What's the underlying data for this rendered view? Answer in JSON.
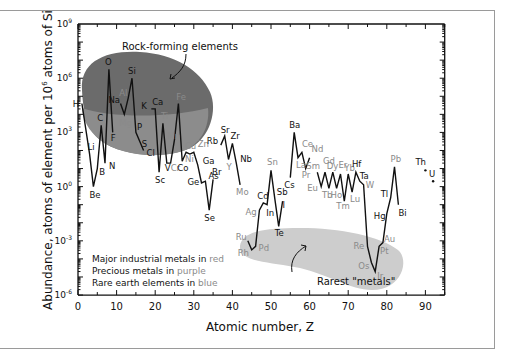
{
  "chart_data": {
    "type": "line",
    "title": "",
    "xlabel": "Atomic number, Z",
    "ylabel": "Abundance, atoms of element per 10^6 atoms of Si",
    "ylabel_parts": {
      "pre": "Abundance, atoms of element per 10",
      "sup": "6",
      "post": " atoms of Si"
    },
    "xlim": [
      0,
      95
    ],
    "ylim_log10": [
      -6,
      9
    ],
    "xticks": [
      0,
      10,
      20,
      30,
      40,
      50,
      60,
      70,
      80,
      90
    ],
    "yticks": [
      {
        "base": "10",
        "exp": "9",
        "v": 9
      },
      {
        "base": "10",
        "exp": "6",
        "v": 6
      },
      {
        "base": "10",
        "exp": "3",
        "v": 3
      },
      {
        "base": "10",
        "exp": "0",
        "v": 0
      },
      {
        "base": "10",
        "exp": "-3",
        "v": -3
      },
      {
        "base": "10",
        "exp": "-6",
        "v": -6
      }
    ],
    "grid": false,
    "y_scale": "log",
    "colors": {
      "red": "#7a7a7a",
      "purple": "#8a8a8a",
      "blue": "#8a8a8a",
      "black": "#111111",
      "rock_region": "#6e6e6e",
      "rock_region_light": "#8f8f8f",
      "rare_region": "#cfcfcf"
    },
    "elements": [
      {
        "s": "H",
        "z": 1,
        "log": 4.6,
        "c": "black",
        "dx": -9,
        "dy": 3
      },
      {
        "s": "Li",
        "z": 3,
        "log": 1.8,
        "c": "black",
        "dx": -2,
        "dy": -4
      },
      {
        "s": "Be",
        "z": 4,
        "log": 0.0,
        "c": "black",
        "dx": -4,
        "dy": 11
      },
      {
        "s": "B",
        "z": 5,
        "log": 1.0,
        "c": "black",
        "dx": 2,
        "dy": 6
      },
      {
        "s": "C",
        "z": 6,
        "log": 3.4,
        "c": "black",
        "dx": -4,
        "dy": -4
      },
      {
        "s": "N",
        "z": 7,
        "log": 1.3,
        "c": "black",
        "dx": 4,
        "dy": 6
      },
      {
        "s": "O",
        "z": 8,
        "log": 6.5,
        "c": "black",
        "dx": -4,
        "dy": -4
      },
      {
        "s": "F",
        "z": 9,
        "log": 3.0,
        "c": "black",
        "dx": -2,
        "dy": 9
      },
      {
        "s": "Na",
        "z": 11,
        "log": 4.6,
        "c": "black",
        "dx": -12,
        "dy": -1
      },
      {
        "s": "Mg",
        "z": 12,
        "log": 4.0,
        "c": "red",
        "dx": -5,
        "dy": 12
      },
      {
        "s": "Al",
        "z": 13,
        "log": 4.9,
        "c": "red",
        "dx": -9,
        "dy": -2
      },
      {
        "s": "Si",
        "z": 14,
        "log": 6.0,
        "c": "black",
        "dx": -4,
        "dy": -4
      },
      {
        "s": "P",
        "z": 15,
        "log": 3.0,
        "c": "black",
        "dx": 1,
        "dy": -2
      },
      {
        "s": "S",
        "z": 16,
        "log": 2.5,
        "c": "black",
        "dx": 2,
        "dy": 6
      },
      {
        "s": "Cl",
        "z": 17,
        "log": 2.0,
        "c": "black",
        "dx": 3,
        "dy": 6
      },
      {
        "s": "K",
        "z": 19,
        "log": 4.3,
        "c": "black",
        "dx": -10,
        "dy": 0
      },
      {
        "s": "Ca",
        "z": 20,
        "log": 4.3,
        "c": "black",
        "dx": -3,
        "dy": -4
      },
      {
        "s": "Sc",
        "z": 21,
        "log": 0.8,
        "c": "black",
        "dx": -4,
        "dy": 11
      },
      {
        "s": "Ti",
        "z": 22,
        "log": 3.5,
        "c": "red",
        "dx": -2,
        "dy": -4
      },
      {
        "s": "V",
        "z": 23,
        "log": 1.3,
        "c": "black",
        "dx": -2,
        "dy": 8
      },
      {
        "s": "Cr",
        "z": 24,
        "log": 1.3,
        "c": "red",
        "dx": 0,
        "dy": 8
      },
      {
        "s": "Mn",
        "z": 25,
        "log": 2.6,
        "c": "red",
        "dx": -7,
        "dy": -1
      },
      {
        "s": "Fe",
        "z": 26,
        "log": 4.6,
        "c": "red",
        "dx": -2,
        "dy": -4
      },
      {
        "s": "Co",
        "z": 27,
        "log": 1.4,
        "c": "black",
        "dx": -5,
        "dy": 10
      },
      {
        "s": "Ni",
        "z": 28,
        "log": 1.9,
        "c": "red",
        "dx": -1,
        "dy": 10
      },
      {
        "s": "Cu",
        "z": 29,
        "log": 1.8,
        "c": "red",
        "dx": -5,
        "dy": -5
      },
      {
        "s": "Zn",
        "z": 30,
        "log": 1.9,
        "c": "red",
        "dx": 4,
        "dy": -5
      },
      {
        "s": "Ga",
        "z": 31,
        "log": 1.2,
        "c": "black",
        "dx": 5,
        "dy": -1
      },
      {
        "s": "Ge",
        "z": 32,
        "log": 0.2,
        "c": "black",
        "dx": -14,
        "dy": 2
      },
      {
        "s": "As",
        "z": 33,
        "log": 0.3,
        "c": "black",
        "dx": 3,
        "dy": -2
      },
      {
        "s": "Se",
        "z": 34,
        "log": -1.3,
        "c": "black",
        "dx": -5,
        "dy": 11
      },
      {
        "s": "Br",
        "z": 35,
        "log": 0.4,
        "c": "black",
        "dx": -1,
        "dy": -4
      },
      {
        "s": "Rb",
        "z": 37,
        "log": 2.3,
        "c": "black",
        "dx": -14,
        "dy": -1
      },
      {
        "s": "Sr",
        "z": 38,
        "log": 2.8,
        "c": "black",
        "dx": -4,
        "dy": -3
      },
      {
        "s": "Y",
        "z": 39,
        "log": 1.5,
        "c": "blue",
        "dx": -2,
        "dy": 10
      },
      {
        "s": "Zr",
        "z": 40,
        "log": 2.4,
        "c": "black",
        "dx": -2,
        "dy": -4
      },
      {
        "s": "Nb",
        "z": 41,
        "log": 1.3,
        "c": "black",
        "dx": 4,
        "dy": -1
      },
      {
        "s": "Mo",
        "z": 42,
        "log": 0.1,
        "c": "red",
        "dx": -4,
        "dy": 10
      },
      {
        "s": "Ru",
        "z": 44,
        "log": -3.0,
        "c": "purple",
        "dx": -12,
        "dy": -1
      },
      {
        "s": "Rh",
        "z": 45,
        "log": -3.5,
        "c": "purple",
        "dx": -14,
        "dy": 6
      },
      {
        "s": "Pd",
        "z": 46,
        "log": -3.3,
        "c": "purple",
        "dx": 3,
        "dy": 5
      },
      {
        "s": "Ag",
        "z": 47,
        "log": -1.3,
        "c": "purple",
        "dx": -14,
        "dy": 5
      },
      {
        "s": "Cd",
        "z": 48,
        "log": -0.9,
        "c": "black",
        "dx": -6,
        "dy": -4
      },
      {
        "s": "In",
        "z": 49,
        "log": -1.0,
        "c": "black",
        "dx": -1,
        "dy": 11
      },
      {
        "s": "Sn",
        "z": 50,
        "log": 0.9,
        "c": "red",
        "dx": -4,
        "dy": -5
      },
      {
        "s": "Sb",
        "z": 51,
        "log": -0.7,
        "c": "black",
        "dx": 2,
        "dy": -4
      },
      {
        "s": "Te",
        "z": 52,
        "log": -2.2,
        "c": "black",
        "dx": -4,
        "dy": 10
      },
      {
        "s": "I",
        "z": 53,
        "log": -0.8,
        "c": "black",
        "dx": 0,
        "dy": 7
      },
      {
        "s": "Cs",
        "z": 55,
        "log": 0.5,
        "c": "black",
        "dx": -6,
        "dy": 10
      },
      {
        "s": "Ba",
        "z": 56,
        "log": 3.0,
        "c": "black",
        "dx": -5,
        "dy": -4
      },
      {
        "s": "La",
        "z": 57,
        "log": 1.6,
        "c": "blue",
        "dx": -2,
        "dy": 10
      },
      {
        "s": "Ce",
        "z": 58,
        "log": 1.9,
        "c": "blue",
        "dx": 0,
        "dy": -5
      },
      {
        "s": "Pr",
        "z": 59,
        "log": 1.0,
        "c": "blue",
        "dx": -4,
        "dy": 9
      },
      {
        "s": "Nd",
        "z": 60,
        "log": 1.6,
        "c": "blue",
        "dx": 2,
        "dy": -6
      },
      {
        "s": "Sm",
        "z": 62,
        "log": 0.8,
        "c": "blue",
        "dx": -11,
        "dy": -3
      },
      {
        "s": "Eu",
        "z": 63,
        "log": 0.0,
        "c": "blue",
        "dx": -14,
        "dy": 4
      },
      {
        "s": "Gd",
        "z": 64,
        "log": 0.8,
        "c": "blue",
        "dx": -2,
        "dy": -8
      },
      {
        "s": "Tb",
        "z": 65,
        "log": -0.1,
        "c": "blue",
        "dx": -7,
        "dy": 10
      },
      {
        "s": "Dy",
        "z": 66,
        "log": 0.8,
        "c": "blue",
        "dx": -6,
        "dy": -3
      },
      {
        "s": "Ho",
        "z": 67,
        "log": -0.1,
        "c": "blue",
        "dx": -6,
        "dy": 10
      },
      {
        "s": "Er",
        "z": 68,
        "log": 0.7,
        "c": "blue",
        "dx": -2,
        "dy": -6
      },
      {
        "s": "Tm",
        "z": 69,
        "log": -0.8,
        "c": "blue",
        "dx": -8,
        "dy": 8
      },
      {
        "s": "Yb",
        "z": 70,
        "log": 0.7,
        "c": "blue",
        "dx": -4,
        "dy": -3
      },
      {
        "s": "Lu",
        "z": 71,
        "log": -0.3,
        "c": "blue",
        "dx": -2,
        "dy": 10
      },
      {
        "s": "Hf",
        "z": 72,
        "log": 0.8,
        "c": "black",
        "dx": -4,
        "dy": -5
      },
      {
        "s": "Ta",
        "z": 73,
        "log": 0.3,
        "c": "black",
        "dx": 0,
        "dy": -2
      },
      {
        "s": "W",
        "z": 74,
        "log": 0.1,
        "c": "red",
        "dx": 2,
        "dy": 3
      },
      {
        "s": "Re",
        "z": 75,
        "log": -3.3,
        "c": "purple",
        "dx": -14,
        "dy": 3
      },
      {
        "s": "Os",
        "z": 76,
        "log": -4.2,
        "c": "purple",
        "dx": -13,
        "dy": 6
      },
      {
        "s": "Ir",
        "z": 77,
        "log": -4.7,
        "c": "purple",
        "dx": 2,
        "dy": 7
      },
      {
        "s": "Pt",
        "z": 78,
        "log": -3.3,
        "c": "purple",
        "dx": 1,
        "dy": 8
      },
      {
        "s": "Au",
        "z": 79,
        "log": -3.1,
        "c": "purple",
        "dx": 1,
        "dy": -1
      },
      {
        "s": "Hg",
        "z": 80,
        "log": -1.5,
        "c": "black",
        "dx": -13,
        "dy": 5
      },
      {
        "s": "Tl",
        "z": 81,
        "log": -0.6,
        "c": "black",
        "dx": -10,
        "dy": 0
      },
      {
        "s": "Pb",
        "z": 82,
        "log": 1.1,
        "c": "red",
        "dx": -4,
        "dy": -5
      },
      {
        "s": "Bi",
        "z": 83,
        "log": -1.0,
        "c": "black",
        "dx": 0,
        "dy": 11
      }
    ],
    "line_order": [
      "H",
      "Li",
      "Be",
      "B",
      "C",
      "N",
      "O",
      "F",
      "|",
      "Na",
      "Mg",
      "Al",
      "Si",
      "P",
      "S",
      "Cl",
      "|",
      "K",
      "Ca",
      "Sc",
      "Ti",
      "V",
      "Cr",
      "Mn",
      "Fe",
      "Co",
      "Ni",
      "Cu",
      "Zn",
      "Ga",
      "Ge",
      "As",
      "Se",
      "Br",
      "|",
      "Rb",
      "Sr",
      "Y",
      "Zr",
      "Nb",
      "Mo",
      "|",
      "Ru",
      "Rh",
      "Pd",
      "Ag",
      "Cd",
      "In",
      "Sn",
      "Sb",
      "Te",
      "I",
      "|",
      "Cs",
      "Ba",
      "La",
      "Ce",
      "Pr",
      "Nd",
      "|",
      "Sm",
      "Eu",
      "Gd",
      "Tb",
      "Dy",
      "Ho",
      "Er",
      "Tm",
      "Yb",
      "Lu",
      "Hf",
      "Ta",
      "W",
      "Re",
      "Os",
      "Ir",
      "Pt",
      "Au",
      "Hg",
      "Tl",
      "Pb",
      "Bi"
    ],
    "isolated_points": [
      {
        "s": "Th",
        "z": 90,
        "log": 0.9,
        "c": "black",
        "dx": -10,
        "dy": -5
      },
      {
        "s": "U",
        "z": 92,
        "log": 0.3,
        "c": "black",
        "dx": -4,
        "dy": -4
      }
    ],
    "annotations": [
      {
        "text": "Rock-forming elements",
        "x": 122,
        "y": 50
      },
      {
        "text": "Rarest \"metals\"",
        "x": 318,
        "y": 284
      }
    ],
    "legend_text": [
      {
        "pre": "Major industrial metals in ",
        "colored": "red",
        "c": "red"
      },
      {
        "pre": "Precious metals in ",
        "colored": "purple",
        "c": "purple"
      },
      {
        "pre": "Rare earth elements in ",
        "colored": "blue",
        "c": "blue"
      }
    ]
  }
}
